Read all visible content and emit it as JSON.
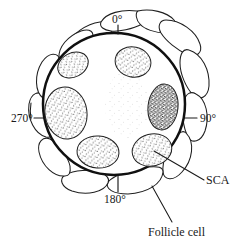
{
  "figure": {
    "type": "biological-line-diagram",
    "background_color": "#ffffff",
    "ink_color": "#1a1a1a"
  },
  "axis_labels": [
    {
      "id": "deg0",
      "text": "0°",
      "position": "top"
    },
    {
      "id": "deg90",
      "text": "90°",
      "position": "right"
    },
    {
      "id": "deg180",
      "text": "180°",
      "position": "bottom"
    },
    {
      "id": "deg270",
      "text": "270°",
      "position": "left"
    }
  ],
  "callouts": [
    {
      "id": "sca",
      "text": "SCA",
      "points_to": "stippled-ellipse-lower-right"
    },
    {
      "id": "follicle",
      "text": "Follicle cell",
      "points_to": "follicle-lobe-bottom-right"
    }
  ],
  "structures": {
    "oocyte_outline": {
      "shape": "circle",
      "center_x": 114,
      "center_y": 104,
      "radius": 71,
      "stroke_width": 2.4,
      "fill": "#ffffff"
    },
    "stippled_ellipses": [
      {
        "id": "sca-upper-left",
        "cx": 73,
        "cy": 65,
        "rx": 16,
        "ry": 12,
        "rotation": -28,
        "shade": "light"
      },
      {
        "id": "sca-upper-right",
        "cx": 133,
        "cy": 62,
        "rx": 18,
        "ry": 15,
        "rotation": 12,
        "shade": "light"
      },
      {
        "id": "sca-left",
        "cx": 66,
        "cy": 113,
        "rx": 21,
        "ry": 26,
        "rotation": -8,
        "shade": "light"
      },
      {
        "id": "sca-right-dark",
        "cx": 163,
        "cy": 107,
        "rx": 15,
        "ry": 23,
        "rotation": 6,
        "shade": "dark"
      },
      {
        "id": "sca-lower-left",
        "cx": 98,
        "cy": 152,
        "rx": 21,
        "ry": 16,
        "rotation": 4,
        "shade": "light"
      },
      {
        "id": "sca-lower-right",
        "cx": 152,
        "cy": 150,
        "rx": 20,
        "ry": 16,
        "rotation": -14,
        "shade": "light"
      }
    ],
    "diffuse_stipple_region": {
      "cx": 127,
      "cy": 105,
      "rx": 22,
      "ry": 34,
      "shade": "very-light"
    },
    "follicle_cell_count": 10
  },
  "colors": {
    "ink": "#1a1a1a",
    "stipple_light": "#6e6e6e",
    "stipple_dark": "#2e2e2e",
    "paper": "#ffffff"
  }
}
